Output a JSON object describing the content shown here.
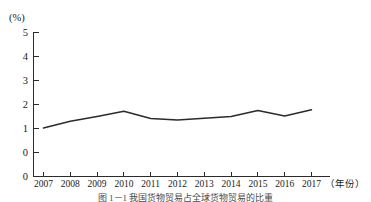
{
  "figure": {
    "caption": "图 1－1  我国货物贸易占全球货物贸易的比重"
  },
  "chart_data": {
    "type": "line",
    "title": "",
    "xlabel": "（年份）",
    "ylabel": "(%)",
    "y_unit_label": "(%)",
    "x_axis_name": "（年份）",
    "categories": [
      "2007",
      "2008",
      "2009",
      "2010",
      "2011",
      "2012",
      "2013",
      "2014",
      "2015",
      "2016",
      "2017"
    ],
    "values": [
      1.02,
      1.3,
      1.5,
      1.72,
      1.42,
      1.35,
      1.43,
      1.5,
      1.75,
      1.52,
      1.78
    ],
    "series": [
      {
        "name": "比重",
        "values": [
          1.02,
          1.3,
          1.5,
          1.72,
          1.42,
          1.35,
          1.43,
          1.5,
          1.75,
          1.52,
          1.78
        ],
        "color": "#2b2b2b"
      }
    ],
    "xlim": [
      2007,
      2017
    ],
    "ylim": [
      0,
      5
    ],
    "yticks": [
      0,
      1,
      2,
      3,
      4,
      5
    ],
    "ytick_labels": [
      "0",
      "1",
      "2",
      "3",
      "4",
      "5"
    ],
    "y_baseline_label": "0",
    "xticks": [
      2007,
      2008,
      2009,
      2010,
      2011,
      2012,
      2013,
      2014,
      2015,
      2016,
      2017
    ],
    "xtick_labels": [
      "2007",
      "2008",
      "2009",
      "2010",
      "2011",
      "2012",
      "2013",
      "2014",
      "2015",
      "2016",
      "2017"
    ],
    "grid": false,
    "legend": false,
    "legend_position": "none",
    "line_color": "#2b2b2b",
    "axis_color": "#2b2b2b"
  }
}
